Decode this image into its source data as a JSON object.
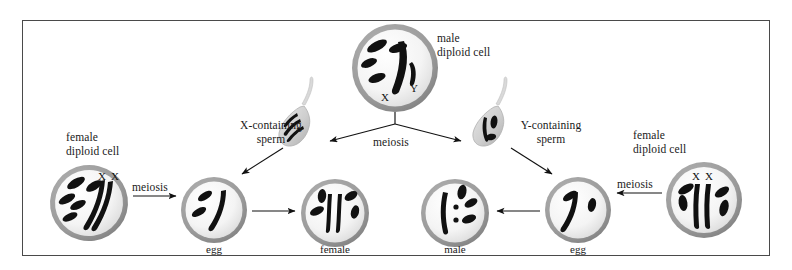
{
  "figure": {
    "frame": {
      "border_color": "#4a4a4a"
    }
  },
  "labels": {
    "male_diploid": "male\ndiploid cell",
    "female_diploid_left": "female\ndiploid cell",
    "female_diploid_right": "female\ndiploid cell",
    "x_sperm": "X-containing\nsperm",
    "y_sperm": "Y-containing\nsperm",
    "meiosis_center": "meiosis",
    "meiosis_left": "meiosis",
    "meiosis_right": "meiosis",
    "egg_left": "egg",
    "egg_right": "egg",
    "offspring_female": "female",
    "offspring_male": "male",
    "chrom_x_male": "X",
    "chrom_y_male": "Y",
    "chrom_xx_left": "X X",
    "chrom_xx_right": "X X"
  },
  "colors": {
    "chromosome": "#111111",
    "membrane": "#8d8d8d",
    "cytoplasm": "#f2f2f2",
    "arrow": "#111111",
    "text": "#1a1a1a"
  },
  "cells": [
    {
      "name": "male-diploid-cell",
      "cx": 395,
      "cy": 68,
      "rx": 43,
      "ry": 44
    },
    {
      "name": "female-diploid-cell-left",
      "cx": 89,
      "cy": 203,
      "rx": 39,
      "ry": 38
    },
    {
      "name": "egg-cell-left",
      "cx": 214,
      "cy": 210,
      "rx": 33,
      "ry": 33
    },
    {
      "name": "offspring-female-cell",
      "cx": 335,
      "cy": 213,
      "rx": 34,
      "ry": 34
    },
    {
      "name": "offspring-male-cell",
      "cx": 455,
      "cy": 213,
      "rx": 34,
      "ry": 34
    },
    {
      "name": "egg-cell-right",
      "cx": 578,
      "cy": 210,
      "rx": 33,
      "ry": 33
    },
    {
      "name": "female-diploid-cell-right",
      "cx": 704,
      "cy": 200,
      "rx": 38,
      "ry": 38
    },
    {
      "name": "sperm-x",
      "cx": 300,
      "cy": 130
    },
    {
      "name": "sperm-y",
      "cx": 494,
      "cy": 130
    }
  ]
}
